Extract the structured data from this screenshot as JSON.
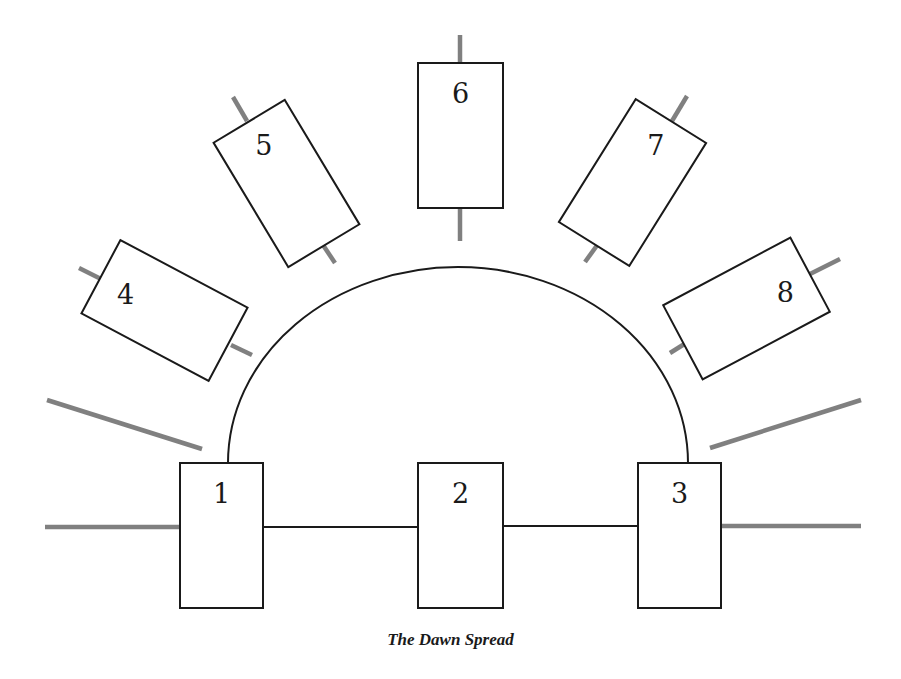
{
  "title": "The Dawn Spread",
  "colors": {
    "outline": "#1a1a1a",
    "stick": "#808080",
    "background": "#ffffff"
  },
  "cards": [
    {
      "id": "1",
      "label": "1",
      "cx": 221.5,
      "cy": 535.5,
      "w": 83,
      "h": 145,
      "angle": 0,
      "label_dx": 0,
      "label_dy": -42
    },
    {
      "id": "2",
      "label": "2",
      "cx": 460.5,
      "cy": 535.5,
      "w": 85,
      "h": 145,
      "angle": 0,
      "label_dx": 0,
      "label_dy": -42
    },
    {
      "id": "3",
      "label": "3",
      "cx": 679.5,
      "cy": 535.5,
      "w": 83,
      "h": 145,
      "angle": 0,
      "label_dx": 0,
      "label_dy": -42
    },
    {
      "id": "4",
      "label": "4",
      "cx": 164.5,
      "cy": 310.5,
      "w": 83,
      "h": 144,
      "angle": -62,
      "label_dx": -4,
      "label_dy": -42
    },
    {
      "id": "5",
      "label": "5",
      "cx": 286.5,
      "cy": 183.5,
      "w": 83,
      "h": 145,
      "angle": -31,
      "label_dx": 0,
      "label_dy": -44
    },
    {
      "id": "6",
      "label": "6",
      "cx": 460.5,
      "cy": 135.5,
      "w": 85,
      "h": 145,
      "angle": 0,
      "label_dx": 0,
      "label_dy": -42
    },
    {
      "id": "7",
      "label": "7",
      "cx": 632.5,
      "cy": 182.5,
      "w": 83,
      "h": 145,
      "angle": 32,
      "label_dx": 0,
      "label_dy": -44
    },
    {
      "id": "8",
      "label": "8",
      "cx": 746.5,
      "cy": 308.5,
      "w": 84,
      "h": 144,
      "angle": 62,
      "label_dx": 4,
      "label_dy": -42
    }
  ],
  "sticks": [
    {
      "name": "stick-card4-outer",
      "x1": 79,
      "y1": 268,
      "x2": 101,
      "y2": 279
    },
    {
      "name": "stick-card4-inner",
      "x1": 231,
      "y1": 345,
      "x2": 252,
      "y2": 355
    },
    {
      "name": "stick-card5-outer",
      "x1": 233,
      "y1": 97,
      "x2": 247,
      "y2": 121
    },
    {
      "name": "stick-card5-inner",
      "x1": 323,
      "y1": 245,
      "x2": 335,
      "y2": 263
    },
    {
      "name": "stick-card6-outer",
      "x1": 460,
      "y1": 35,
      "x2": 460,
      "y2": 63
    },
    {
      "name": "stick-card6-inner",
      "x1": 460,
      "y1": 208,
      "x2": 460,
      "y2": 241
    },
    {
      "name": "stick-card7-outer",
      "x1": 687,
      "y1": 96,
      "x2": 672,
      "y2": 121
    },
    {
      "name": "stick-card7-inner",
      "x1": 598,
      "y1": 244,
      "x2": 585,
      "y2": 262
    },
    {
      "name": "stick-card8-outer",
      "x1": 840,
      "y1": 259,
      "x2": 808,
      "y2": 275
    },
    {
      "name": "stick-card8-inner",
      "x1": 686,
      "y1": 343,
      "x2": 670,
      "y2": 353
    },
    {
      "name": "stick-left-diagonal",
      "x1": 47,
      "y1": 400,
      "x2": 202,
      "y2": 449
    },
    {
      "name": "stick-left-horizontal",
      "x1": 45,
      "y1": 527,
      "x2": 180,
      "y2": 527
    },
    {
      "name": "stick-right-diagonal",
      "x1": 710,
      "y1": 448,
      "x2": 861,
      "y2": 400
    },
    {
      "name": "stick-right-horizontal",
      "x1": 721,
      "y1": 526,
      "x2": 861,
      "y2": 526
    }
  ],
  "connectors": {
    "arc": {
      "x1": 228,
      "y1": 463,
      "x2": 688,
      "y2": 463,
      "rx": 230,
      "ry": 196
    },
    "lines": [
      {
        "name": "connector-1-2",
        "x1": 263,
        "y1": 527,
        "x2": 418,
        "y2": 527
      },
      {
        "name": "connector-2-3",
        "x1": 503,
        "y1": 526,
        "x2": 638,
        "y2": 526
      }
    ]
  }
}
